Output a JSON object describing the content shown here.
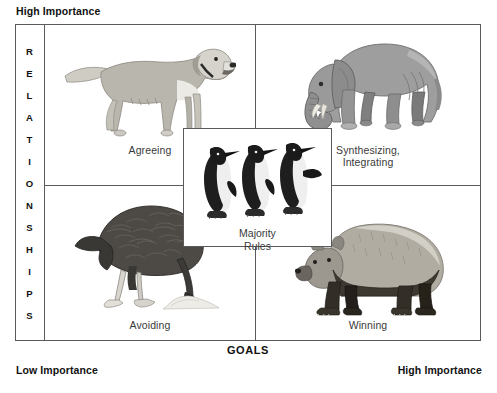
{
  "diagram": {
    "title_visible": false,
    "axes": {
      "vertical_axis_label": "RELATIONSHIPS",
      "vertical_axis_letters": [
        "R",
        "E",
        "L",
        "A",
        "T",
        "I",
        "O",
        "N",
        "S",
        "H",
        "I",
        "P",
        "S"
      ],
      "horizontal_axis_label": "GOALS",
      "top_left_corner_label": "High Importance",
      "bottom_left_corner_label": "Low Importance",
      "bottom_right_corner_label": "High Importance"
    },
    "quadrants": [
      {
        "position": "top-left",
        "label": "Agreeing",
        "animal": "golden-retriever-dog",
        "animal_name": "dog",
        "relationships": "High Importance",
        "goals": "Low Importance"
      },
      {
        "position": "top-right",
        "label": "Synthesizing,\nIntegrating",
        "label_line1": "Synthesizing,",
        "label_line2": "Integrating",
        "animal": "elephant",
        "animal_name": "elephant",
        "relationships": "High Importance",
        "goals": "High Importance"
      },
      {
        "position": "bottom-left",
        "label": "Avoiding",
        "animal": "ostrich-head-in-sand",
        "animal_name": "ostrich",
        "relationships": "Low Importance",
        "goals": "Low Importance"
      },
      {
        "position": "bottom-right",
        "label": "Winning",
        "animal": "grizzly-bear",
        "animal_name": "bear",
        "relationships": "Low Importance",
        "goals": "High Importance"
      }
    ],
    "center": {
      "label_line1": "Majority",
      "label_line2": "Rules",
      "label": "Majority Rules",
      "animal": "penguins",
      "animal_name": "penguin",
      "animal_count": 3
    },
    "colors": {
      "frame_line": "#5a5a5a",
      "background": "#ffffff",
      "label_text": "#3a3a3a",
      "axis_text": "#111111",
      "dog_body": "#b9b6ae",
      "dog_light": "#d7d5cf",
      "elephant_body": "#9b9b9b",
      "elephant_dark": "#6e6e6e",
      "ostrich_body": "#4a4a4a",
      "ostrich_dark": "#262626",
      "bear_body": "#aaa69c",
      "bear_dark": "#3b3630",
      "penguin_dark": "#1c1c1c",
      "penguin_light": "#e8e8e8"
    }
  }
}
